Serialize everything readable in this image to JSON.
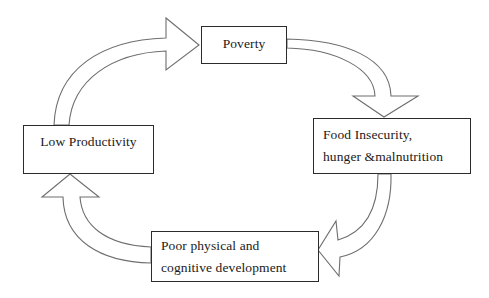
{
  "diagram": {
    "type": "cycle",
    "nodes": [
      {
        "id": "poverty",
        "lines": [
          "Poverty"
        ]
      },
      {
        "id": "food_insecurity",
        "lines": [
          "Food Insecurity,",
          "hunger &malnutrition"
        ]
      },
      {
        "id": "poor_development",
        "lines": [
          "Poor physical and",
          "cognitive development"
        ]
      },
      {
        "id": "low_productivity",
        "lines": [
          "Low Productivity"
        ]
      }
    ],
    "edges": [
      {
        "from": "poverty",
        "to": "food_insecurity",
        "style": "curved-block-arrow"
      },
      {
        "from": "food_insecurity",
        "to": "poor_development",
        "style": "curved-block-arrow"
      },
      {
        "from": "poor_development",
        "to": "low_productivity",
        "style": "curved-block-arrow"
      },
      {
        "from": "low_productivity",
        "to": "poverty",
        "style": "curved-block-arrow"
      }
    ]
  },
  "colors": {
    "stroke": "#2b2b2b",
    "arrow_stroke": "#6e6e6e",
    "background": "#ffffff"
  }
}
